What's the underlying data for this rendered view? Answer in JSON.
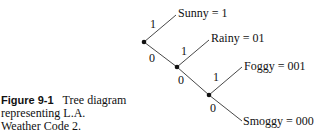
{
  "caption": {
    "number": "Figure 9-1",
    "text_line1": "Tree diagram",
    "text_line2": "representing L.A.",
    "text_line3": "Weather Code 2."
  },
  "tree": {
    "leaves": [
      {
        "label": "Sunny = 1",
        "code": "1"
      },
      {
        "label": "Rainy = 01",
        "code": "01"
      },
      {
        "label": "Foggy = 001",
        "code": "001"
      },
      {
        "label": "Smoggy = 000",
        "code": "000"
      }
    ],
    "edge_labels": {
      "n1_up": "1",
      "n1_down": "0",
      "n2_up": "1",
      "n2_down": "0",
      "n3_up": "1",
      "n3_down": "0"
    }
  }
}
